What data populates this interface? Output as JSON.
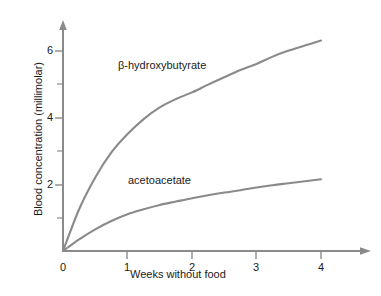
{
  "chart_data": {
    "type": "line",
    "title": "",
    "subtitle": "",
    "xlabel": "Weeks without food",
    "ylabel": "Blood concentration (millimolar)",
    "xlim": [
      0,
      4.75
    ],
    "ylim": [
      0,
      6.9
    ],
    "grid": false,
    "legend_position": "inline-annotations",
    "x_ticks": [
      0,
      1,
      2,
      3,
      4
    ],
    "x_tick_labels": [
      "0",
      "1",
      "2",
      "3",
      "4"
    ],
    "y_ticks": [
      0,
      1,
      2,
      3,
      4,
      5,
      6
    ],
    "y_tick_labels": [
      "",
      "",
      "2",
      "",
      "4",
      "",
      "6"
    ],
    "y_major_ticks": [
      2,
      4,
      6
    ],
    "x": [
      0,
      0.25,
      0.5,
      0.75,
      1,
      1.25,
      1.5,
      1.75,
      2,
      2.25,
      2.5,
      2.75,
      3,
      3.25,
      3.5,
      3.75,
      4
    ],
    "series": [
      {
        "name": "β-hydroxybutyrate",
        "label": "β-hydroxybutyrate",
        "color": "#8a8a8a",
        "values": [
          0,
          1.25,
          2.2,
          2.95,
          3.5,
          3.95,
          4.3,
          4.55,
          4.75,
          4.98,
          5.2,
          5.42,
          5.6,
          5.82,
          6.0,
          6.15,
          6.3
        ]
      },
      {
        "name": "acetoacetate",
        "label": "acetoacetate",
        "color": "#8a8a8a",
        "values": [
          0,
          0.35,
          0.65,
          0.9,
          1.1,
          1.25,
          1.38,
          1.48,
          1.58,
          1.67,
          1.75,
          1.82,
          1.9,
          1.97,
          2.03,
          2.09,
          2.15
        ]
      }
    ],
    "annotations": [
      {
        "text": "β-hydroxybutyrate",
        "x": 0.85,
        "y": 5.75
      },
      {
        "text": "acetoacetate",
        "x": 1.0,
        "y": 2.25
      }
    ],
    "axis_color": "#8a8a8a",
    "text_color": "#1a1a1a",
    "background": "#ffffff"
  },
  "figure": {
    "x_axis_title": "Weeks without food",
    "y_axis_title": "Blood concentration (millimolar)",
    "y_labels": {
      "t2": "2",
      "t4": "4",
      "t6": "6"
    },
    "x_labels": {
      "t0": "0",
      "t1": "1",
      "t2": "2",
      "t3": "3",
      "t4": "4"
    },
    "curve_labels": {
      "bhb": "β-hydroxybutyrate",
      "aca": "acetoacetate"
    }
  }
}
